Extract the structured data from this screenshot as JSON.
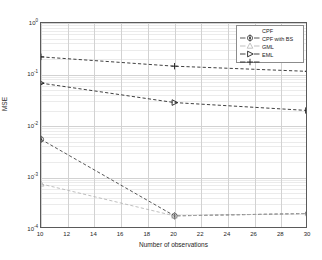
{
  "chart_data": {
    "type": "line",
    "title": "",
    "xlabel": "Number of observations",
    "ylabel": "MSE",
    "xscale": "linear",
    "yscale": "log",
    "xlim": [
      10,
      30
    ],
    "ylim": [
      0.0001,
      1
    ],
    "grid": true,
    "legend_position": "upper right",
    "x": [
      10,
      20,
      30
    ],
    "xticks": [
      "10",
      "12",
      "14",
      "16",
      "18",
      "20",
      "22",
      "24",
      "26",
      "28",
      "30"
    ],
    "ytick_labels": [
      "10^0",
      "10^-1",
      "10^-2",
      "10^-3",
      "10^-4"
    ],
    "ytick_mantissa": [
      "10",
      "10",
      "10",
      "10",
      "10"
    ],
    "ytick_exponent": [
      "0",
      "-1",
      "-2",
      "-3",
      "-4"
    ],
    "series": [
      {
        "name": "CPF",
        "marker": "circle-dot",
        "color": "#3a3a3a",
        "linestyle": "dashed",
        "values": [
          0.0055,
          0.00018,
          0.0002
        ]
      },
      {
        "name": "CPF with BS",
        "marker": "triangle-up",
        "color": "#b4b4b4",
        "linestyle": "dashed",
        "values": [
          0.00075,
          0.00018,
          0.0002
        ]
      },
      {
        "name": "GML",
        "marker": "triangle-right",
        "color": "#1f1f1f",
        "linestyle": "dashed",
        "values": [
          0.068,
          0.0285,
          0.02
        ]
      },
      {
        "name": "EML",
        "marker": "plus",
        "color": "#1f1f1f",
        "linestyle": "dashed",
        "values": [
          0.22,
          0.145,
          0.115
        ]
      }
    ]
  },
  "legend": {
    "entries": [
      {
        "label": "CPF"
      },
      {
        "label": "CPF with BS"
      },
      {
        "label": "GML"
      },
      {
        "label": "EML"
      }
    ]
  },
  "axes": {
    "x_label": "Number of observations",
    "y_label": "MSE"
  }
}
